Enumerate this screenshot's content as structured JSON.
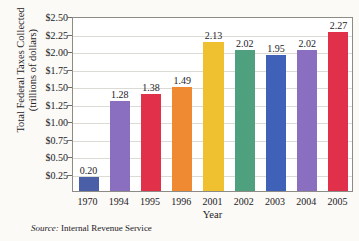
{
  "chart_data": {
    "type": "bar",
    "title": "",
    "xlabel": "Year",
    "ylabel": "Total Federal Taxes Collected (trillions of dollars)",
    "ylabel_line1": "Total Federal Taxes Collected",
    "ylabel_line2": "(trillions of dollars)",
    "categories": [
      "1970",
      "1994",
      "1995",
      "1996",
      "2001",
      "2002",
      "2003",
      "2004",
      "2005"
    ],
    "values": [
      0.2,
      1.28,
      1.38,
      1.49,
      2.13,
      2.02,
      1.95,
      2.02,
      2.27
    ],
    "value_labels": [
      "0.20",
      "1.28",
      "1.38",
      "1.49",
      "2.13",
      "2.02",
      "1.95",
      "2.02",
      "2.27"
    ],
    "bar_colors": [
      "#4a5fa8",
      "#8a6fc0",
      "#e0304a",
      "#ef8a33",
      "#efc030",
      "#4fa07e",
      "#3f62b8",
      "#8a6fc0",
      "#e0304a"
    ],
    "ylim": [
      0,
      2.5
    ],
    "ytick_values": [
      2.5,
      2.25,
      2.0,
      1.75,
      1.5,
      1.25,
      1.0,
      0.75,
      0.5,
      0.25
    ],
    "ytick_labels": [
      "$2.50",
      "$2.25",
      "$2.00",
      "$1.75",
      "$1.50",
      "$1.25",
      "$1.00",
      "$0.75",
      "$0.50",
      "$0.25"
    ],
    "grid": true,
    "grid_axis": "y",
    "legend": false,
    "source_label": "Source:",
    "source_text": "Internal Revenue Service"
  }
}
